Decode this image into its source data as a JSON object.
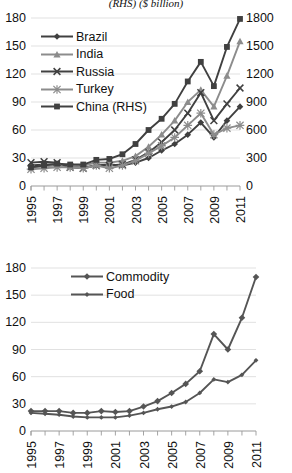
{
  "chart_data": [
    {
      "type": "line",
      "title": "(RHS) ($ billion)",
      "xlabel": "",
      "ylabel": "",
      "ylim": [
        0,
        180
      ],
      "yticks": [
        0,
        30,
        60,
        90,
        120,
        150,
        180
      ],
      "y2lim": [
        0,
        1800
      ],
      "y2ticks": [
        0,
        300,
        600,
        900,
        1200,
        1500,
        1800
      ],
      "grid": true,
      "legend_position": "upper-left",
      "x": [
        1995,
        1996,
        1997,
        1998,
        1999,
        2000,
        2001,
        2002,
        2003,
        2004,
        2005,
        2006,
        2007,
        2008,
        2009,
        2010,
        2011
      ],
      "xticklabels": [
        "1995",
        "",
        "1997",
        "",
        "1999",
        "",
        "2001",
        "",
        "2003",
        "",
        "2005",
        "",
        "2007",
        "",
        "2009",
        "",
        "2011"
      ],
      "series": [
        {
          "name": "Brazil",
          "axis": "left",
          "marker": "diamond",
          "color": "#404040",
          "values": [
            22,
            23,
            23,
            21,
            20,
            22,
            23,
            22,
            25,
            30,
            38,
            45,
            55,
            68,
            52,
            70,
            85
          ]
        },
        {
          "name": "India",
          "axis": "left",
          "marker": "triangle",
          "color": "#8c8c8c",
          "values": [
            20,
            21,
            22,
            21,
            22,
            25,
            25,
            27,
            32,
            42,
            55,
            70,
            90,
            103,
            85,
            118,
            155
          ]
        },
        {
          "name": "Russia",
          "axis": "left",
          "marker": "x",
          "color": "#404040",
          "values": [
            25,
            26,
            25,
            20,
            19,
            22,
            22,
            23,
            28,
            36,
            47,
            60,
            78,
            100,
            70,
            88,
            105
          ]
        },
        {
          "name": "Turkey",
          "axis": "left",
          "marker": "asterisk",
          "color": "#8c8c8c",
          "values": [
            18,
            19,
            20,
            20,
            19,
            22,
            19,
            22,
            27,
            35,
            43,
            52,
            65,
            78,
            55,
            62,
            65
          ]
        },
        {
          "name": "China (RHS)",
          "axis": "right",
          "marker": "square",
          "color": "#404040",
          "values": [
            200,
            220,
            240,
            230,
            230,
            280,
            290,
            340,
            450,
            600,
            720,
            880,
            1120,
            1330,
            1070,
            1490,
            1790
          ]
        }
      ]
    },
    {
      "type": "line",
      "title": "",
      "xlabel": "",
      "ylabel": "",
      "ylim": [
        0,
        180
      ],
      "yticks": [
        0,
        30,
        60,
        90,
        120,
        150,
        180
      ],
      "grid": true,
      "legend_position": "upper-left",
      "x": [
        1995,
        1996,
        1997,
        1998,
        1999,
        2000,
        2001,
        2002,
        2003,
        2004,
        2005,
        2006,
        2007,
        2008,
        2009,
        2010,
        2011
      ],
      "xticklabels": [
        "1995",
        "",
        "1997",
        "",
        "1999",
        "",
        "2001",
        "",
        "2003",
        "",
        "2005",
        "",
        "2007",
        "",
        "2009",
        "",
        "2011"
      ],
      "series": [
        {
          "name": "Commodity",
          "axis": "left",
          "marker": "diamond",
          "color": "#555555",
          "values": [
            22,
            22,
            22,
            20,
            20,
            22,
            21,
            22,
            27,
            33,
            42,
            52,
            66,
            107,
            90,
            125,
            170
          ]
        },
        {
          "name": "Food",
          "axis": "left",
          "marker": "diamond-small",
          "color": "#555555",
          "values": [
            20,
            19,
            18,
            16,
            15,
            15,
            15,
            17,
            20,
            24,
            27,
            32,
            42,
            57,
            54,
            62,
            78
          ]
        }
      ]
    }
  ],
  "charts": [
    {
      "id": "chart1",
      "title": "(RHS) ($ billion)",
      "legend": [
        {
          "label": "Brazil"
        },
        {
          "label": "India"
        },
        {
          "label": "Russia"
        },
        {
          "label": "Turkey"
        },
        {
          "label": "China (RHS)"
        }
      ]
    },
    {
      "id": "chart2",
      "title": "",
      "legend": [
        {
          "label": "Commodity"
        },
        {
          "label": "Food"
        }
      ]
    }
  ]
}
